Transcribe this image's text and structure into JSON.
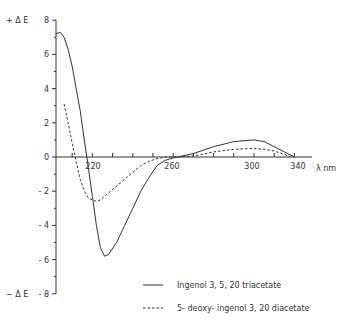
{
  "chart_data": {
    "type": "line",
    "title": "",
    "xlabel": "λ nm",
    "ylabel": "Δ E",
    "ylabel_top": "+ Δ E",
    "ylabel_bottom": "− Δ E",
    "xlim": [
      202,
      325
    ],
    "ylim": [
      -8,
      8
    ],
    "x_ticks": [
      "220",
      "260",
      "300",
      "340"
    ],
    "y_ticks": [
      "8",
      "6",
      "4",
      "2",
      "0",
      "- 2",
      "- 4",
      "- 6",
      "- 8"
    ],
    "grid": false,
    "legend_position": "lower right",
    "series": [
      {
        "name": "Ingenol 3, 5, 20 triacetate",
        "style": "solid",
        "x": [
          202,
          204,
          206,
          208,
          210,
          212,
          214,
          216,
          218,
          220,
          222,
          224,
          226,
          228,
          232,
          236,
          240,
          244,
          248,
          252,
          256,
          260,
          270,
          280,
          290,
          300,
          305,
          310,
          315,
          320
        ],
        "y": [
          7.2,
          7.3,
          7.0,
          6.3,
          5.3,
          4.0,
          2.7,
          1.0,
          -0.6,
          -2.3,
          -4.0,
          -5.3,
          -5.8,
          -5.7,
          -5.0,
          -4.0,
          -3.0,
          -2.0,
          -1.2,
          -0.5,
          -0.2,
          -0.05,
          0.2,
          0.6,
          0.9,
          1.0,
          0.9,
          0.6,
          0.3,
          0.0
        ]
      },
      {
        "name": "5- deoxy- ingenol 3, 20 diacetate",
        "style": "dashed",
        "x": [
          206,
          208,
          210,
          212,
          214,
          216,
          218,
          220,
          222,
          224,
          228,
          232,
          236,
          240,
          244,
          248,
          252,
          256,
          260,
          270,
          280,
          290,
          300,
          305,
          310,
          315,
          318
        ],
        "y": [
          3.1,
          2.0,
          0.8,
          -0.3,
          -1.3,
          -2.0,
          -2.4,
          -2.5,
          -2.6,
          -2.5,
          -2.1,
          -1.7,
          -1.3,
          -0.9,
          -0.5,
          -0.25,
          -0.1,
          0.0,
          0.0,
          0.05,
          0.3,
          0.45,
          0.5,
          0.45,
          0.35,
          0.15,
          0.0
        ]
      }
    ]
  },
  "legend": {
    "items": [
      {
        "marker": "—",
        "label": "Ingenol  3, 5, 20  triacetate"
      },
      {
        "marker": "----",
        "label": "5- deoxy- ingenol  3, 20  diacetate"
      }
    ]
  },
  "axes": {
    "y_top_label": "+ Δ E",
    "y_bottom_label": "− Δ E",
    "x_unit": "λ nm"
  }
}
